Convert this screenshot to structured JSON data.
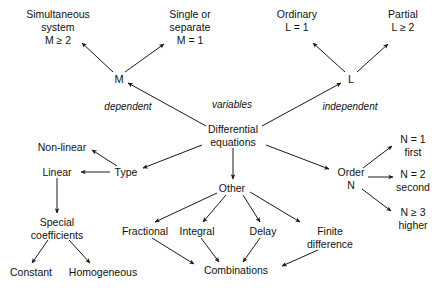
{
  "diagram": {
    "background_color": "#ffffff",
    "stroke_color": "#1a1a1a",
    "text_color": "#111111",
    "nodes": {
      "root": {
        "line1": "Differential",
        "line2": "equations"
      },
      "m": {
        "label": "M"
      },
      "l": {
        "label": "L"
      },
      "simultaneous": {
        "line1": "Simultaneous",
        "line2": "system",
        "line3": "M ≥ 2"
      },
      "single": {
        "line1": "Single or",
        "line2": "separate",
        "line3": "M = 1"
      },
      "ordinary": {
        "line1": "Ordinary",
        "line2": "L = 1"
      },
      "partial": {
        "line1": "Partial",
        "line2": "L ≥ 2"
      },
      "type": {
        "label": "Type"
      },
      "nonlinear": {
        "label": "Non-linear"
      },
      "linear": {
        "label": "Linear"
      },
      "special": {
        "line1": "Special",
        "line2": "coefficients"
      },
      "constant": {
        "label": "Constant"
      },
      "homogeneous": {
        "label": "Homogeneous"
      },
      "other": {
        "label": "Other"
      },
      "fractional": {
        "label": "Fractional"
      },
      "integral": {
        "label": "Integral"
      },
      "delay": {
        "label": "Delay"
      },
      "finite_difference": {
        "line1": "Finite",
        "line2": "difference"
      },
      "combinations": {
        "label": "Combinations"
      },
      "order": {
        "line1": "Order",
        "line2": "N"
      },
      "first": {
        "line1": "N = 1",
        "line2": "first"
      },
      "second": {
        "line1": "N = 2",
        "line2": "second"
      },
      "higher": {
        "line1": "N ≥ 3",
        "line2": "higher"
      }
    },
    "edge_labels": {
      "dependent": "dependent",
      "variables": "variables",
      "independent": "independent"
    }
  }
}
